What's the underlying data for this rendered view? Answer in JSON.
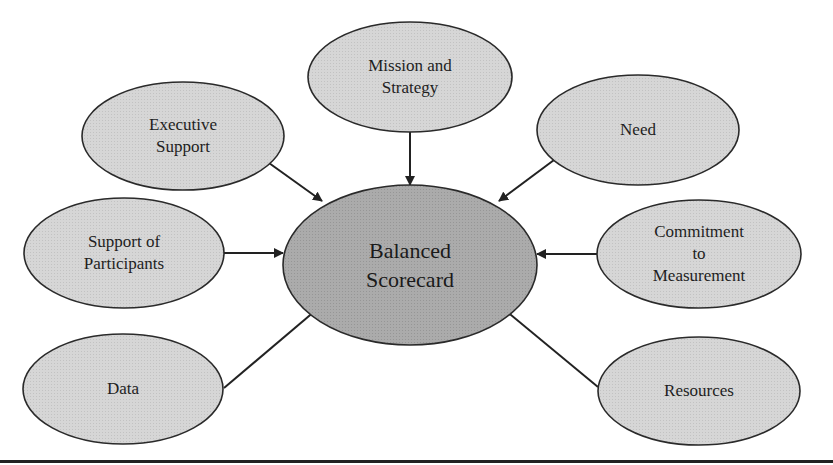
{
  "diagram": {
    "center": {
      "id": "balanced-scorecard",
      "lines": [
        "Balanced",
        "Scorecard"
      ],
      "cx": 410,
      "cy": 265,
      "rx": 127,
      "ry": 80,
      "fill": "#a9a9a9"
    },
    "nodes": [
      {
        "id": "mission-and-strategy",
        "lines": [
          "Mission and",
          "Strategy"
        ],
        "cx": 410,
        "cy": 77,
        "rx": 102,
        "ry": 55,
        "arrow": {
          "x1": 410,
          "y1": 132,
          "x2": 410,
          "y2": 185
        }
      },
      {
        "id": "executive-support",
        "lines": [
          "Executive",
          "Support"
        ],
        "cx": 183,
        "cy": 136,
        "rx": 101,
        "ry": 54,
        "arrow": {
          "x1": 269,
          "y1": 163,
          "x2": 322,
          "y2": 201
        }
      },
      {
        "id": "need",
        "lines": [
          "Need"
        ],
        "cx": 638,
        "cy": 130,
        "rx": 101,
        "ry": 55,
        "arrow": {
          "x1": 554,
          "y1": 160,
          "x2": 499,
          "y2": 201
        }
      },
      {
        "id": "support-of-participants",
        "lines": [
          "Support of",
          "Participants"
        ],
        "cx": 124,
        "cy": 253,
        "rx": 100,
        "ry": 55,
        "arrow": {
          "x1": 224,
          "y1": 253,
          "x2": 283,
          "y2": 253
        }
      },
      {
        "id": "commitment-to-measurement",
        "lines": [
          "Commitment",
          "to",
          "Measurement"
        ],
        "cx": 699,
        "cy": 254,
        "rx": 102,
        "ry": 54,
        "arrow": {
          "x1": 597,
          "y1": 254,
          "x2": 537,
          "y2": 254
        }
      },
      {
        "id": "data",
        "lines": [
          "Data"
        ],
        "cx": 123,
        "cy": 389,
        "rx": 100,
        "ry": 55,
        "arrow": {
          "x1": 224,
          "y1": 388,
          "x2": 322,
          "y2": 305
        }
      },
      {
        "id": "resources",
        "lines": [
          "Resources"
        ],
        "cx": 699,
        "cy": 391,
        "rx": 101,
        "ry": 54,
        "arrow": {
          "x1": 598,
          "y1": 387,
          "x2": 499,
          "y2": 305
        }
      }
    ],
    "colors": {
      "node_fill": "#d4d4d4",
      "center_fill": "#a9a9a9",
      "stroke": "#2a2a2a",
      "arrow": "#222222"
    }
  }
}
